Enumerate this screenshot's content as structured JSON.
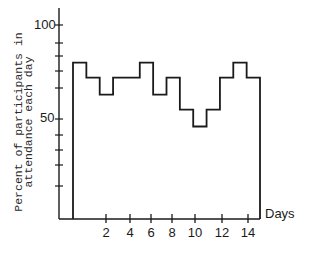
{
  "chart_data": {
    "type": "line",
    "style": "step",
    "title": "",
    "xlabel": "Days",
    "ylabel": "Percent of participants in attendance each day",
    "ylabel_lines": [
      "Percent of participants in",
      "attendance each day"
    ],
    "x": [
      1,
      2,
      3,
      4,
      5,
      6,
      7,
      8,
      9,
      10,
      11,
      12,
      13,
      14
    ],
    "series": [
      {
        "name": "Attendance",
        "values": [
          80,
          72,
          63,
          72,
          72,
          80,
          63,
          72,
          55,
          46,
          55,
          72,
          80,
          72
        ]
      }
    ],
    "xticks": [
      "2",
      "4",
      "6",
      "8",
      "10",
      "12",
      "14"
    ],
    "yticks_labeled": [
      "50",
      "100"
    ],
    "ylim": [
      0,
      110
    ],
    "xlim": [
      0,
      15
    ],
    "grid": false,
    "legend": null
  },
  "axis": {
    "y_label_100": "100",
    "y_label_50": "50",
    "x_label": "Days"
  }
}
